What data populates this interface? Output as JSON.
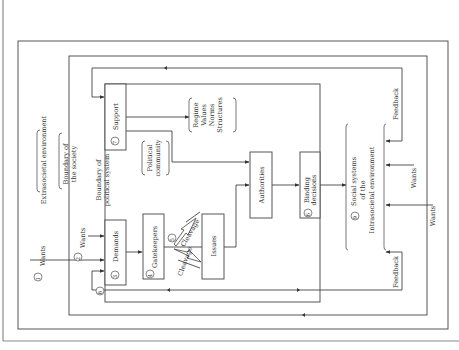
{
  "figure": {
    "environment": {
      "extrasocietal": "Extrasocietal environment",
      "boundary_society_line1": "Boundary of",
      "boundary_society_line2": "the society",
      "boundary_polsys_line1": "Boundary of",
      "boundary_polsys_line2": "political system",
      "intrasocietal_line1": "Social systems",
      "intrasocietal_line2": "of the",
      "intrasocietal_line3": "Intrasocietal environment"
    },
    "nodes": {
      "wants_1": {
        "num": "1",
        "label": "Wants"
      },
      "wants_2": {
        "num": "2",
        "label": "Wants"
      },
      "demands": {
        "num": "3",
        "label": "Demands"
      },
      "gatekeepers": {
        "num": "4",
        "label": "Gatekeepers"
      },
      "cleavage": {
        "num": "5",
        "label_a": "Cleavage",
        "label_b": "Cleavage"
      },
      "issues": {
        "label": "Issues"
      },
      "authorities": {
        "label": "Authorities"
      },
      "binding": {
        "num": "6",
        "label_line1": "Binding",
        "label_line2": "decisions"
      },
      "support": {
        "num": "7",
        "label": "Support"
      },
      "feedback_loop": {
        "num": "8"
      },
      "social_systems": {
        "num": "9"
      },
      "political_community_line1": "Political",
      "political_community_line2": "community",
      "regime": [
        "Regime",
        "Values",
        "Norms",
        "Structures"
      ],
      "wants_right_a": "Wants",
      "wants_right_b": "Wants",
      "feedback_top": "Feedback",
      "feedback_bottom": "Feedback"
    }
  },
  "colors": {
    "line": "#444444",
    "frame": "#8a8a8a",
    "text": "#333333",
    "background": "#ffffff"
  }
}
